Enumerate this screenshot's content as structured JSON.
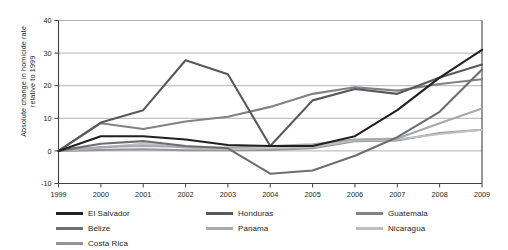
{
  "chart_data": {
    "type": "line",
    "title": "",
    "xlabel": "",
    "ylabel": "Absolute change in homicide rate\nrelative to 1999",
    "x": [
      1999,
      2000,
      2001,
      2002,
      2003,
      2004,
      2005,
      2006,
      2007,
      2008,
      2009
    ],
    "xlim": [
      1999,
      2009
    ],
    "ylim": [
      -10,
      40
    ],
    "yticks": [
      -10,
      0,
      10,
      20,
      30,
      40
    ],
    "ytick_labels": [
      "-10",
      "0",
      "10",
      "20",
      "30",
      "40"
    ],
    "xtick_labels": [
      "1999",
      "2000",
      "2001",
      "2002",
      "2003",
      "2004",
      "2005",
      "2006",
      "2007",
      "2008",
      "2009"
    ],
    "grid": "horizontal",
    "legend_position": "bottom",
    "series": [
      {
        "name": "El Salvador",
        "color": "#231f20",
        "values": [
          0,
          4.5,
          4.5,
          3.5,
          1.8,
          1.5,
          1.5,
          4.5,
          12.5,
          22.5,
          31
        ]
      },
      {
        "name": "Honduras",
        "color": "#58595b",
        "values": [
          0,
          8.7,
          12.5,
          27.8,
          23.5,
          1.5,
          15.5,
          19,
          17.5,
          22.5,
          26.5
        ]
      },
      {
        "name": "Guatemala",
        "color": "#808285",
        "values": [
          0,
          8.5,
          6.7,
          9,
          10.5,
          13.5,
          17.5,
          19.5,
          18.5,
          20.5,
          22
        ]
      },
      {
        "name": "Belize",
        "color": "#6d6e71",
        "values": [
          0,
          2.2,
          3,
          1.5,
          0.8,
          -7,
          -6,
          -1.5,
          4.2,
          12,
          25
        ]
      },
      {
        "name": "Panama",
        "color": "#a7a9ac",
        "values": [
          0,
          1.2,
          1.5,
          1.2,
          1.0,
          1.5,
          2.0,
          3.5,
          3.8,
          8.5,
          13
        ]
      },
      {
        "name": "Nicaragua",
        "color": "#bcbec0",
        "values": [
          0,
          1.0,
          2.2,
          1.0,
          0.5,
          0.8,
          1.2,
          3.2,
          3.5,
          5.2,
          6.5
        ]
      },
      {
        "name": "Costa Rica",
        "color": "#939598",
        "values": [
          0,
          0.3,
          0.5,
          0.2,
          0.2,
          0.3,
          0.8,
          3.0,
          3.2,
          5.5,
          6.5
        ]
      }
    ]
  },
  "legend": {
    "items": [
      {
        "label": "El Salvador",
        "color": "#231f20"
      },
      {
        "label": "Honduras",
        "color": "#58595b"
      },
      {
        "label": "Guatemala",
        "color": "#808285"
      },
      {
        "label": "Panama",
        "color": "#a7a9ac"
      },
      {
        "label": "Nicaragua",
        "color": "#bcbec0"
      },
      {
        "label": "Costa Rica",
        "color": "#939598"
      },
      {
        "label": "Belize",
        "color": "#6d6e71"
      }
    ]
  },
  "axis": {
    "y_title": "Absolute change in homicide rate\nrelative to 1999"
  }
}
